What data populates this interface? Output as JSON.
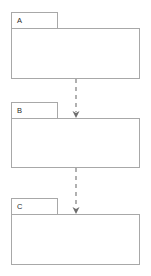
{
  "diagram": {
    "type": "uml-package-diagram",
    "canvas": {
      "width": 151,
      "height": 276,
      "background": "#ffffff"
    },
    "style": {
      "package_border_color": "#a8a8a8",
      "package_fill_color": "#ffffff",
      "label_color": "#2b2b2b",
      "dependency_color": "#7d7d7d",
      "arrowhead_color": "#6e6e6e",
      "dependency_dash": "4 4"
    },
    "packages": [
      {
        "id": "pkg-a",
        "label": "A",
        "tab": {
          "x": 11,
          "y": 12,
          "width": 47,
          "height": 16
        },
        "body": {
          "x": 11,
          "y": 28,
          "width": 129,
          "height": 51
        },
        "label_pos": {
          "x": 17,
          "y": 20.5
        }
      },
      {
        "id": "pkg-b",
        "label": "B",
        "tab": {
          "x": 11,
          "y": 102,
          "width": 47,
          "height": 16
        },
        "body": {
          "x": 11,
          "y": 118,
          "width": 129,
          "height": 50
        },
        "label_pos": {
          "x": 17,
          "y": 110.5
        }
      },
      {
        "id": "pkg-c",
        "label": "C",
        "tab": {
          "x": 11,
          "y": 198,
          "width": 47,
          "height": 16
        },
        "body": {
          "x": 11,
          "y": 214,
          "width": 129,
          "height": 51
        },
        "label_pos": {
          "x": 17,
          "y": 206.5
        }
      }
    ],
    "dependencies": [
      {
        "id": "dep-a-b",
        "from": "pkg-a",
        "to": "pkg-b",
        "label": "",
        "line": {
          "x1": 76,
          "y1": 79,
          "x2": 76,
          "y2": 112
        },
        "arrowhead": {
          "x": 76,
          "y": 118,
          "width": 7,
          "height": 6
        }
      },
      {
        "id": "dep-b-c",
        "from": "pkg-b",
        "to": "pkg-c",
        "label": "",
        "line": {
          "x1": 76,
          "y1": 168,
          "x2": 76,
          "y2": 208
        },
        "arrowhead": {
          "x": 76,
          "y": 214,
          "width": 7,
          "height": 6
        }
      }
    ]
  }
}
